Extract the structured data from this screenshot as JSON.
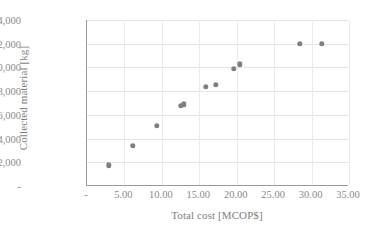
{
  "chart_data": {
    "type": "scatter",
    "title": "",
    "xlabel": "Total cost [MCOP$]",
    "ylabel": "Collected material [kg]",
    "xlim": [
      0,
      35
    ],
    "ylim": [
      0,
      14000
    ],
    "grid": true,
    "legend": "none",
    "marker_color": "#7f7f7f",
    "x_tick_labels": [
      "-",
      "5.00",
      "10.00",
      "15.00",
      "20.00",
      "25.00",
      "30.00",
      "35.00"
    ],
    "x_tick_values": [
      0,
      5,
      10,
      15,
      20,
      25,
      30,
      35
    ],
    "y_tick_labels": [
      "-",
      "2,000",
      "4,000",
      "6,000",
      "8,000",
      "10,000",
      "12,000",
      "14,000"
    ],
    "y_tick_values": [
      0,
      2000,
      4000,
      6000,
      8000,
      10000,
      12000,
      14000
    ],
    "series": [
      {
        "name": "Collected material",
        "points": [
          {
            "x": 2.9,
            "y": 1750
          },
          {
            "x": 6.1,
            "y": 3400
          },
          {
            "x": 9.3,
            "y": 5100
          },
          {
            "x": 12.5,
            "y": 6750
          },
          {
            "x": 12.9,
            "y": 6900
          },
          {
            "x": 15.9,
            "y": 8350
          },
          {
            "x": 17.2,
            "y": 8550
          },
          {
            "x": 19.6,
            "y": 9900
          },
          {
            "x": 20.4,
            "y": 10250
          },
          {
            "x": 28.4,
            "y": 12000
          },
          {
            "x": 31.4,
            "y": 12000
          }
        ]
      }
    ]
  }
}
